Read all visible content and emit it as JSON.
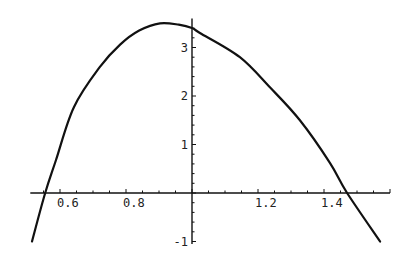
{
  "chart_data": {
    "type": "line",
    "title": "",
    "xlabel": "",
    "ylabel": "",
    "xlim": [
      0.51,
      1.6
    ],
    "ylim": [
      -1.05,
      3.6
    ],
    "axes_origin": [
      1.0,
      0
    ],
    "grid": false,
    "x_ticks_major": [
      0.6,
      0.8,
      1.2,
      1.4
    ],
    "x_tick_labels": [
      "0.6",
      "0.8",
      "1.2",
      "1.4"
    ],
    "y_ticks_major": [
      -1,
      1,
      2,
      3
    ],
    "y_tick_labels": [
      "-1",
      "1",
      "2",
      "3"
    ],
    "series": [
      {
        "name": "f(x)",
        "x": [
          0.515,
          0.555,
          0.588,
          0.642,
          0.721,
          0.782,
          0.84,
          0.903,
          0.96,
          1.0,
          1.024,
          1.145,
          1.236,
          1.327,
          1.418,
          1.47,
          1.57
        ],
        "y": [
          -1.0,
          0.0,
          0.68,
          1.77,
          2.6,
          3.06,
          3.35,
          3.5,
          3.47,
          3.4,
          3.3,
          2.8,
          2.18,
          1.5,
          0.62,
          0.0,
          -1.0
        ]
      }
    ]
  }
}
